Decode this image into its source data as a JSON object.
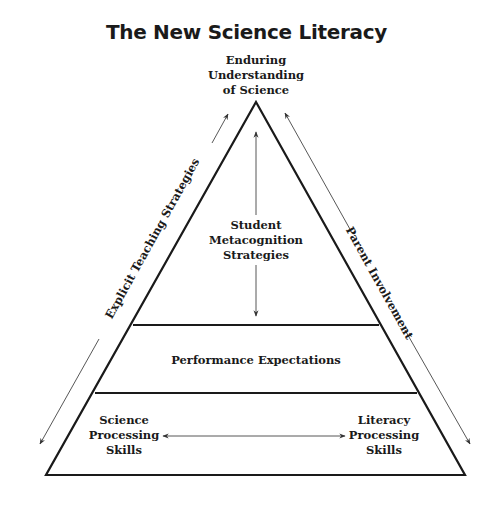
{
  "title": "The New Science Literacy",
  "apex_label": {
    "line1": "Enduring",
    "line2": "Understanding",
    "line3": "of Science"
  },
  "tiers": [
    {
      "name": "top",
      "label_line1": "Student",
      "label_line2": "Metacognition",
      "label_line3": "Strategies"
    },
    {
      "name": "middle",
      "label": "Performance Expectations"
    },
    {
      "name": "bottom",
      "left_line1": "Science",
      "left_line2": "Processing",
      "left_line3": "Skills",
      "right_line1": "Literacy",
      "right_line2": "Processing",
      "right_line3": "Skills"
    }
  ],
  "side_labels": {
    "left": "Explicit Teaching Strategies",
    "right": "Parent Involvement"
  },
  "colors": {
    "stroke": "#1a1a1a",
    "arrow": "#444444",
    "background": "#ffffff"
  }
}
